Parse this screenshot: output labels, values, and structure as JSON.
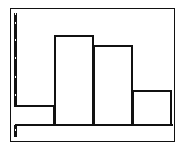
{
  "chart_data": {
    "type": "bar",
    "subtype": "histogram",
    "title": "",
    "xlabel": "",
    "ylabel": "",
    "categories": [
      "bin1",
      "bin2",
      "bin3",
      "bin4"
    ],
    "values": [
      2,
      9,
      8,
      3.5
    ],
    "ylim": [
      0,
      11
    ],
    "grid": false,
    "legend": null,
    "y_tick_spacing_units": 1.8,
    "colors": {
      "bar_edge": "#111111",
      "bar_fill": "#ffffff",
      "background": "#ffffff"
    }
  },
  "layout": {
    "plot_left": 16,
    "plot_right": 172,
    "axis_y": 125,
    "px_per_unit": 10,
    "ticks_y": [
      13,
      22,
      39,
      57,
      76,
      94,
      111,
      129
    ]
  }
}
